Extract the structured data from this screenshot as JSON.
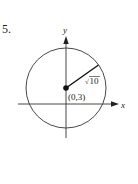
{
  "problem": {
    "number": "5."
  },
  "diagram": {
    "type": "circle-on-axes",
    "axes": {
      "x_label": "x",
      "y_label": "y"
    },
    "circle": {
      "center_label": "(0,3)",
      "center": [
        0,
        3
      ],
      "radius_label": "√10",
      "radius_radicand": "10",
      "radius_symbol": "√"
    },
    "colors": {
      "stroke": "#222222",
      "background": "#ffffff"
    }
  }
}
